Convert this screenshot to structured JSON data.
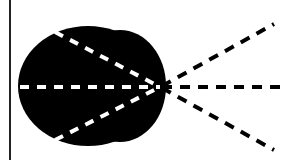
{
  "diagram": {
    "type": "optics-lens-ray-diagram",
    "colors": {
      "background": "#ffffff",
      "shape_fill": "#000000",
      "inner_rays": "#ffffff",
      "outer_rays": "#000000",
      "border_line": "#222222"
    },
    "border_line": {
      "x": 10,
      "y1": 0,
      "y2": 160
    },
    "focal_point": {
      "x": 160,
      "y": 87
    },
    "inner_rays": [
      {
        "from": [
          55,
          32
        ],
        "to": [
          160,
          87
        ]
      },
      {
        "from": [
          20,
          87
        ],
        "to": [
          160,
          87
        ]
      },
      {
        "from": [
          55,
          140
        ],
        "to": [
          160,
          87
        ]
      }
    ],
    "outer_rays": [
      {
        "from": [
          160,
          87
        ],
        "to": [
          274,
          24
        ]
      },
      {
        "from": [
          160,
          87
        ],
        "to": [
          281,
          87
        ]
      },
      {
        "from": [
          160,
          87
        ],
        "to": [
          274,
          150
        ]
      }
    ]
  }
}
